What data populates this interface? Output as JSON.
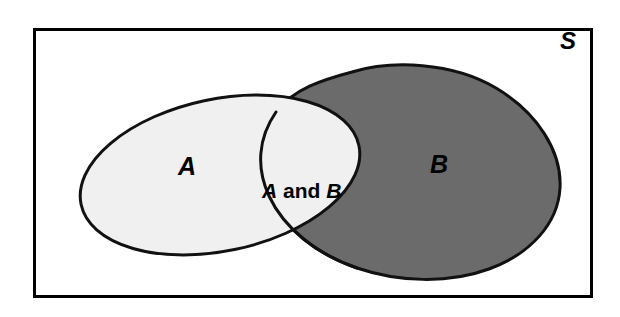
{
  "diagram": {
    "type": "venn-diagram",
    "sample_space": {
      "label": "S",
      "name": "sample-space-rectangle",
      "border_color": "#000000",
      "fill_color": "#ffffff"
    },
    "sets": [
      {
        "id": "A",
        "label": "A",
        "name": "set-a-ellipse",
        "fill_color": "#f0f0f0",
        "stroke_color": "#111111",
        "shape": "ellipse-tilted"
      },
      {
        "id": "B",
        "label": "B",
        "name": "set-b-blob",
        "fill_color": "#6b6b6b",
        "stroke_color": "#111111",
        "shape": "rounded-blob"
      }
    ],
    "intersection": {
      "id": "A_and_B",
      "label_parts": {
        "first": "A",
        "conjunction": " and ",
        "second": "B"
      },
      "label_plain": "A and B",
      "name": "intersection-region",
      "fill_color": "#f0f0f0"
    }
  }
}
